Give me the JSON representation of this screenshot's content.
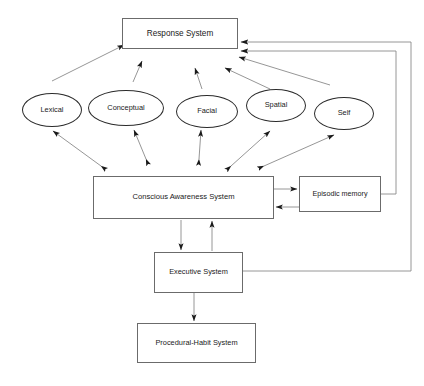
{
  "diagram": {
    "type": "flow-diagram",
    "background_color": "#ffffff",
    "box_border_color": "#6b6b6b",
    "ellipse_border_color": "#2b2b2b",
    "edge_color": "#8a8a8a",
    "arrowhead_color": "#1a1a1a",
    "text_color": "#1a1a1a",
    "nodes": {
      "response_system": {
        "label": "Response  System",
        "shape": "rectangle",
        "x": 122,
        "y": 18,
        "w": 116,
        "h": 31,
        "font_size": 8.2
      },
      "lexical": {
        "label": "Lexical",
        "shape": "ellipse",
        "x": 22,
        "y": 93,
        "w": 60,
        "h": 34,
        "font_size": 7.4
      },
      "conceptual": {
        "label": "Conceptual",
        "shape": "ellipse",
        "x": 88,
        "y": 90,
        "w": 76,
        "h": 36,
        "font_size": 7.4
      },
      "facial": {
        "label": "Facial",
        "shape": "ellipse",
        "x": 176,
        "y": 95,
        "w": 62,
        "h": 33,
        "font_size": 7.4
      },
      "spatial": {
        "label": "Spatial",
        "shape": "ellipse",
        "x": 246,
        "y": 89,
        "w": 60,
        "h": 33,
        "font_size": 7.4
      },
      "self": {
        "label": "Self",
        "shape": "ellipse",
        "x": 314,
        "y": 97,
        "w": 60,
        "h": 33,
        "font_size": 7.4
      },
      "conscious_awareness_system": {
        "label": "Conscious Awareness System",
        "shape": "rectangle",
        "x": 93,
        "y": 176,
        "w": 181,
        "h": 43,
        "font_size": 7.6
      },
      "episodic_memory": {
        "label": "Episodic memory",
        "shape": "rectangle",
        "x": 299,
        "y": 176,
        "w": 82,
        "h": 36,
        "font_size": 7.2
      },
      "executive_system": {
        "label": "Executive System",
        "shape": "rectangle",
        "x": 154,
        "y": 252,
        "w": 89,
        "h": 41,
        "font_size": 7.4
      },
      "procedural_habit_system": {
        "label": "Procedural-Habit System",
        "shape": "rectangle",
        "x": 137,
        "y": 323,
        "w": 119,
        "h": 40,
        "font_size": 7.4
      }
    },
    "edges": [
      {
        "name": "lexical-to-response",
        "from": "lexical",
        "to": "response_system",
        "direction": "one-way"
      },
      {
        "name": "conceptual-to-response",
        "from": "conceptual",
        "to": "response_system",
        "direction": "one-way"
      },
      {
        "name": "facial-to-response",
        "from": "facial",
        "to": "response_system",
        "direction": "one-way"
      },
      {
        "name": "spatial-to-response",
        "from": "spatial",
        "to": "response_system",
        "direction": "one-way"
      },
      {
        "name": "self-to-response",
        "from": "self",
        "to": "response_system",
        "direction": "one-way"
      },
      {
        "name": "cas-to-lexical",
        "from": "conscious_awareness_system",
        "to": "lexical",
        "direction": "two-way"
      },
      {
        "name": "cas-to-conceptual",
        "from": "conscious_awareness_system",
        "to": "conceptual",
        "direction": "two-way"
      },
      {
        "name": "cas-to-facial",
        "from": "conscious_awareness_system",
        "to": "facial",
        "direction": "two-way"
      },
      {
        "name": "cas-to-spatial",
        "from": "conscious_awareness_system",
        "to": "spatial",
        "direction": "two-way"
      },
      {
        "name": "cas-to-self",
        "from": "conscious_awareness_system",
        "to": "self",
        "direction": "two-way"
      },
      {
        "name": "cas-to-episodic",
        "from": "conscious_awareness_system",
        "to": "episodic_memory",
        "direction": "one-way"
      },
      {
        "name": "episodic-to-cas",
        "from": "episodic_memory",
        "to": "conscious_awareness_system",
        "direction": "one-way"
      },
      {
        "name": "cas-to-executive",
        "from": "conscious_awareness_system",
        "to": "executive_system",
        "direction": "one-way"
      },
      {
        "name": "executive-to-cas",
        "from": "executive_system",
        "to": "conscious_awareness_system",
        "direction": "one-way"
      },
      {
        "name": "executive-to-procedural",
        "from": "executive_system",
        "to": "procedural_habit_system",
        "direction": "one-way"
      },
      {
        "name": "episodic-to-response",
        "from": "episodic_memory",
        "to": "response_system",
        "direction": "one-way",
        "routing": "orthogonal-right"
      },
      {
        "name": "executive-to-response",
        "from": "executive_system",
        "to": "response_system",
        "direction": "one-way",
        "routing": "orthogonal-right"
      }
    ]
  }
}
